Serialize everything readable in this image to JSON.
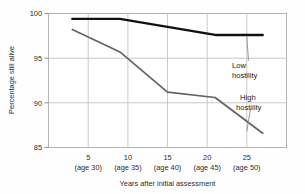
{
  "chart_data": {
    "type": "line",
    "title": "",
    "xlabel": "Years after initial assessment",
    "ylabel": "Percentage still alive",
    "x": [
      5,
      10,
      15,
      20,
      25
    ],
    "categories": [
      "5",
      "10",
      "15",
      "20",
      "25"
    ],
    "sublabels": [
      "(age 30)",
      "(age 35)",
      "(age 40)",
      "(age 45)",
      "(age 50)"
    ],
    "xlim": [
      2.5,
      27.5
    ],
    "ylim": [
      85,
      100
    ],
    "yticks": [
      85,
      90,
      95,
      100
    ],
    "ytick_labels": [
      "85",
      "90",
      "95",
      "100"
    ],
    "grid": true,
    "legend_position": "inline-annotation",
    "series": [
      {
        "name": "Low hostility",
        "color": "#111111",
        "width": 2.4,
        "values": [
          99.4,
          99.4,
          98.5,
          97.6,
          97.6
        ]
      },
      {
        "name": "High hostility",
        "color": "#636363",
        "width": 1.7,
        "values": [
          98.2,
          95.7,
          91.2,
          90.6,
          86.6
        ]
      }
    ],
    "annotations": [
      {
        "text_line1": "Low",
        "text_line2": "hostility",
        "target_series": "Low hostility"
      },
      {
        "text_line1": "High",
        "text_line2": "hostility",
        "target_series": "High hostility"
      }
    ]
  },
  "axis": {
    "ytick_100": "100",
    "ytick_95": "95",
    "ytick_90": "90",
    "ytick_85": "85",
    "xtick_1": "5",
    "xtick_2": "10",
    "xtick_3": "15",
    "xtick_4": "20",
    "xtick_5": "25",
    "xsub_1": "(age 30)",
    "xsub_2": "(age 35)",
    "xsub_3": "(age 40)",
    "xsub_4": "(age 45)",
    "xsub_5": "(age 50)",
    "y_title": "Percentage still alive",
    "x_title": "Years after initial assessment"
  },
  "labels": {
    "low_1": "Low",
    "low_2": "hostility",
    "high_1": "High",
    "high_2": "hostility"
  },
  "colors": {
    "low_hostility": "#111111",
    "high_hostility": "#636363",
    "grid": "#c9c9c9",
    "frame": "#b4b4b4",
    "background": "#fefefe"
  }
}
